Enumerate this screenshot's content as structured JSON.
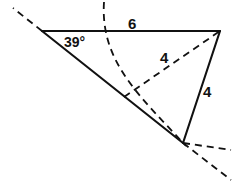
{
  "figure": {
    "background_color": "#ffffff",
    "stroke_color": "#111111",
    "width": 232,
    "height": 191,
    "labels": {
      "angle_a": "39°",
      "side_top": "6",
      "side_diagonal": "4",
      "side_right": "4"
    },
    "label_positions": {
      "angle_a": {
        "x": 64,
        "y": 35
      },
      "side_top": {
        "x": 128,
        "y": 16
      },
      "side_diagonal": {
        "x": 160,
        "y": 50
      },
      "side_right": {
        "x": 203,
        "y": 84
      }
    },
    "vertices": {
      "left": {
        "x": 42,
        "y": 31
      },
      "top_right": {
        "x": 220,
        "y": 31
      },
      "mid": {
        "x": 124,
        "y": 97
      },
      "bottom": {
        "x": 183,
        "y": 143
      }
    },
    "solid_edges": [
      {
        "name": "top-edge",
        "x1": 42,
        "y1": 31,
        "x2": 220,
        "y2": 31
      },
      {
        "name": "left-ray-edge",
        "x1": 42,
        "y1": 31,
        "x2": 183,
        "y2": 143
      },
      {
        "name": "right-edge",
        "x1": 220,
        "y1": 31,
        "x2": 183,
        "y2": 143
      }
    ],
    "dashed_edges": [
      {
        "name": "alternate-side",
        "x1": 124,
        "y1": 97,
        "x2": 220,
        "y2": 31
      },
      {
        "name": "ray-extension-upper-left",
        "x1": 42,
        "y1": 31,
        "x2": 13,
        "y2": 8
      },
      {
        "name": "ray-extension-lower-right",
        "x1": 183,
        "y1": 143,
        "x2": 231,
        "y2": 180
      },
      {
        "name": "ray-extension-right",
        "x1": 183,
        "y1": 143,
        "x2": 231,
        "y2": 150
      }
    ],
    "dashed_arc": {
      "name": "compass-arc",
      "start": {
        "x": 104,
        "y": 2
      },
      "control1": {
        "x": 100,
        "y": 62
      },
      "control2": {
        "x": 140,
        "y": 96
      },
      "end": {
        "x": 186,
        "y": 146
      }
    },
    "stroke_widths": {
      "solid": 2.1,
      "dashed": 1.8,
      "arc": 1.8
    },
    "dash_patterns": {
      "dashed": "7 5",
      "arc": "7 5"
    }
  }
}
